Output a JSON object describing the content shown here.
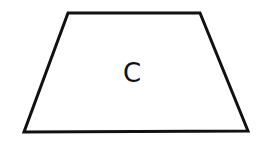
{
  "diagram": {
    "shape": "trapezoid",
    "label": "C",
    "stroke_color": "#111111",
    "fill_color": "#ffffff",
    "vertices": [
      [
        68,
        13
      ],
      [
        200,
        13
      ],
      [
        248,
        131
      ],
      [
        24,
        132
      ]
    ]
  }
}
